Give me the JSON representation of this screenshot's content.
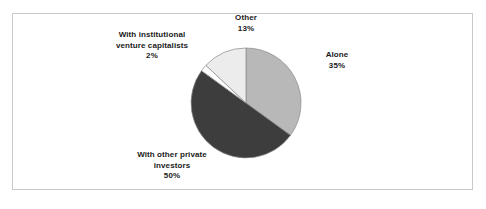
{
  "chart_data": {
    "type": "pie",
    "title": "",
    "subtitle": "",
    "xlabel": "",
    "ylabel": "",
    "legend_position": "none",
    "grid": false,
    "start_angle_deg": 0,
    "direction": "clockwise",
    "categories": [
      "Alone",
      "With other private investors",
      "With institutional venture capitalists",
      "Other"
    ],
    "values": [
      35,
      50,
      2,
      13
    ],
    "value_suffix": "%",
    "slices": [
      {
        "name": "Alone",
        "label_line1": "Alone",
        "label_line2": "",
        "value": 35,
        "value_text": "35%",
        "color": "#b8b8b8",
        "start_deg": 0,
        "end_deg": 126
      },
      {
        "name": "With other private investors",
        "label_line1": "With other private",
        "label_line2": "investors",
        "value": 50,
        "value_text": "50%",
        "color": "#3d3d3d",
        "start_deg": 126,
        "end_deg": 306
      },
      {
        "name": "With institutional venture capitalists",
        "label_line1": "With institutional",
        "label_line2": "venture capitalists",
        "value": 2,
        "value_text": "2%",
        "color": "#fdfdfd",
        "start_deg": 306,
        "end_deg": 313.2
      },
      {
        "name": "Other",
        "label_line1": "Other",
        "label_line2": "",
        "value": 13,
        "value_text": "13%",
        "color": "#ececec",
        "start_deg": 313.2,
        "end_deg": 360
      }
    ]
  },
  "figure": {
    "border_color": "#c9c9c9",
    "background": "#ffffff",
    "slice_outline_color": "#8a8a8a"
  },
  "labels": {
    "other": {
      "line1": "Other",
      "pct": "13%"
    },
    "institutional": {
      "line1": "With institutional",
      "line2": "venture capitalists",
      "pct": "2%"
    },
    "alone": {
      "line1": "Alone",
      "pct": "35%"
    },
    "private": {
      "line1": "With other private",
      "line2": "investors",
      "pct": "50%"
    }
  }
}
